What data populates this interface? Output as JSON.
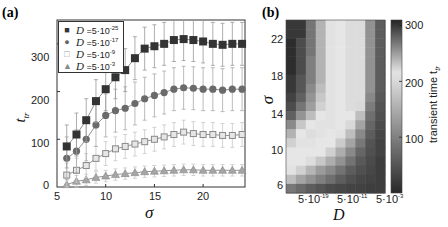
{
  "panel_a": {
    "label": "(a)",
    "xlabel": "σ",
    "ylabel": "t",
    "ylabel_sub": "tr",
    "xticks": [
      "5",
      "10",
      "15",
      "20"
    ],
    "yticks": [
      "0",
      "100",
      "200",
      "300"
    ],
    "legend": [
      {
        "symbol": "■",
        "prefix": "D",
        "text": " =5·10",
        "exp": "-25"
      },
      {
        "symbol": "●",
        "prefix": "D",
        "text": " =5·10",
        "exp": "-17"
      },
      {
        "symbol": "□",
        "prefix": "D",
        "text": " =5·10",
        "exp": "-9"
      },
      {
        "symbol": "▲",
        "prefix": "D",
        "text": " =5·10",
        "exp": "-3"
      }
    ]
  },
  "panel_b": {
    "label": "(b)",
    "xlabel": "D",
    "ylabel": "σ",
    "yticks": [
      "6",
      "10",
      "14",
      "18",
      "22"
    ],
    "xticks": [
      {
        "base": "5·10",
        "exp": "-19"
      },
      {
        "base": "5·10",
        "exp": "-11"
      },
      {
        "base": "5·10",
        "exp": "-3"
      }
    ],
    "colorbar_ticks": [
      "100",
      "200",
      "300"
    ],
    "colorbar_label": "transient time t",
    "colorbar_label_sub": "tr"
  },
  "chart_data": [
    {
      "type": "line",
      "title": "(a)",
      "xlabel": "σ",
      "ylabel": "t_tr",
      "xlim": [
        5,
        24.3
      ],
      "ylim": [
        0,
        350
      ],
      "x": [
        6,
        7,
        8,
        9,
        10,
        11,
        12,
        13,
        14,
        15,
        16,
        17,
        18,
        19,
        20,
        21,
        22,
        23,
        24
      ],
      "series": [
        {
          "name": "D=5·10^-25",
          "marker": "filled-square",
          "color": "#333333",
          "values": [
            85,
            110,
            140,
            180,
            205,
            230,
            245,
            270,
            290,
            295,
            300,
            308,
            310,
            308,
            305,
            300,
            298,
            300,
            300
          ],
          "error": 45
        },
        {
          "name": "D=5·10^-17",
          "marker": "filled-circle",
          "color": "#666666",
          "values": [
            60,
            75,
            100,
            130,
            150,
            160,
            165,
            175,
            185,
            192,
            198,
            205,
            208,
            207,
            205,
            205,
            203,
            205,
            205
          ],
          "error": 45
        },
        {
          "name": "D=5·10^-9",
          "marker": "open-square",
          "color": "#999999",
          "values": [
            25,
            35,
            45,
            60,
            70,
            80,
            85,
            90,
            95,
            100,
            105,
            110,
            115,
            112,
            110,
            110,
            108,
            108,
            110
          ],
          "error": 25
        },
        {
          "name": "D=5·10^-3",
          "marker": "triangle",
          "color": "#888888",
          "values": [
            5,
            12,
            15,
            20,
            23,
            26,
            28,
            30,
            32,
            33,
            34,
            35,
            36,
            36,
            35,
            35,
            35,
            35,
            35
          ],
          "error": 12
        }
      ],
      "legend_position": "upper-left",
      "grid": false
    },
    {
      "type": "heatmap",
      "title": "(b)",
      "xlabel": "D",
      "ylabel": "σ",
      "x_ticks": [
        "5·10^-19",
        "5·10^-11",
        "5·10^-3"
      ],
      "y_ticks": [
        6,
        10,
        14,
        18,
        22
      ],
      "colorbar": {
        "label": "transient time t_tr",
        "ticks": [
          100,
          200,
          300
        ],
        "range": [
          0,
          310
        ]
      },
      "rows_sigma_top_to_bottom": [
        24,
        23,
        22,
        21,
        20,
        19,
        18,
        17,
        16,
        15,
        14,
        13,
        12,
        11,
        10,
        9,
        8,
        7,
        6
      ],
      "values": [
        [
          300,
          300,
          270,
          240,
          210,
          215,
          220,
          220,
          120,
          60
        ],
        [
          300,
          300,
          270,
          240,
          210,
          215,
          220,
          220,
          120,
          60
        ],
        [
          305,
          290,
          270,
          240,
          210,
          215,
          220,
          220,
          120,
          60
        ],
        [
          305,
          290,
          270,
          240,
          210,
          215,
          220,
          220,
          120,
          60
        ],
        [
          305,
          290,
          265,
          240,
          210,
          215,
          220,
          220,
          120,
          60
        ],
        [
          305,
          290,
          265,
          240,
          210,
          215,
          220,
          220,
          120,
          60
        ],
        [
          300,
          285,
          265,
          240,
          210,
          215,
          220,
          220,
          120,
          60
        ],
        [
          300,
          285,
          260,
          235,
          210,
          215,
          220,
          220,
          120,
          60
        ],
        [
          295,
          280,
          255,
          230,
          210,
          215,
          220,
          220,
          110,
          55
        ],
        [
          290,
          270,
          250,
          225,
          210,
          215,
          220,
          200,
          95,
          50
        ],
        [
          280,
          255,
          235,
          215,
          210,
          215,
          215,
          170,
          80,
          45
        ],
        [
          260,
          230,
          215,
          210,
          210,
          215,
          200,
          140,
          70,
          40
        ],
        [
          240,
          215,
          205,
          210,
          215,
          210,
          170,
          110,
          60,
          35
        ],
        [
          225,
          210,
          210,
          215,
          215,
          185,
          140,
          90,
          50,
          30
        ],
        [
          215,
          215,
          215,
          215,
          190,
          150,
          110,
          70,
          45,
          30
        ],
        [
          215,
          215,
          205,
          180,
          150,
          120,
          85,
          55,
          40,
          25
        ],
        [
          210,
          190,
          160,
          130,
          110,
          85,
          60,
          45,
          35,
          25
        ],
        [
          170,
          140,
          120,
          100,
          80,
          60,
          45,
          35,
          30,
          25
        ],
        [
          90,
          75,
          60,
          50,
          40,
          35,
          30,
          28,
          25,
          25
        ]
      ]
    }
  ]
}
